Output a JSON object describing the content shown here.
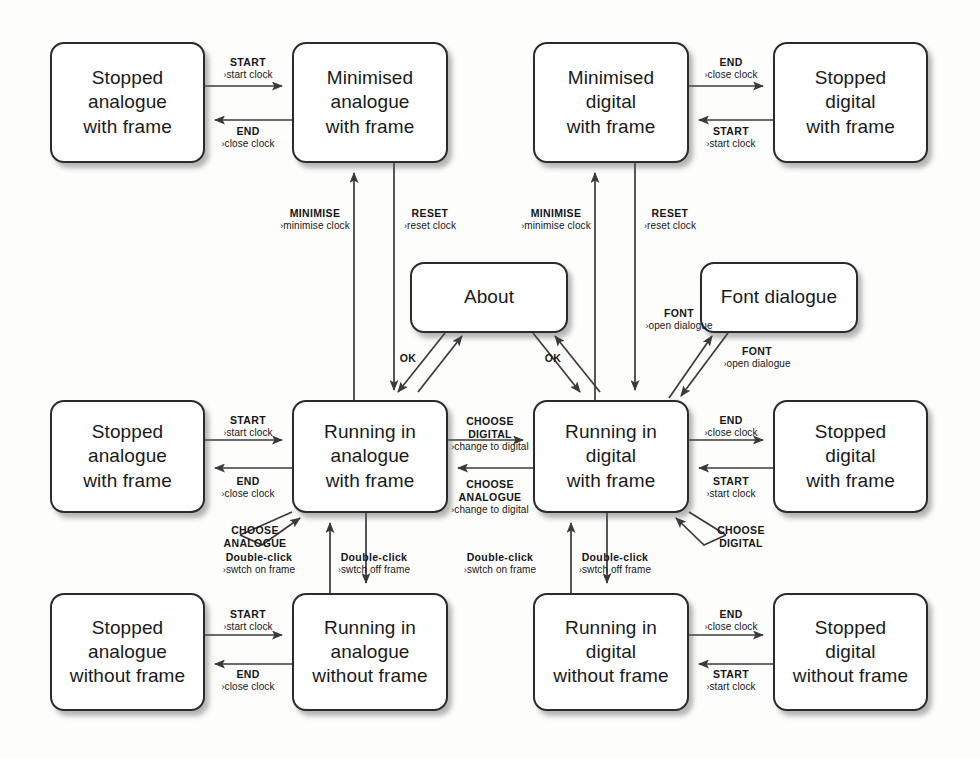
{
  "diagram": {
    "accent": "#2b2b2b",
    "background": "#fdfdfc"
  },
  "states": [
    {
      "id": "stopped-analogue-with-frame",
      "label": "Stopped\nanalogue\nwith frame",
      "x": 50,
      "y": 42,
      "w": 155,
      "h": 121
    },
    {
      "id": "minimised-analogue-with-frame",
      "label": "Minimised\nanalogue\nwith frame",
      "x": 292,
      "y": 42,
      "w": 156,
      "h": 121
    },
    {
      "id": "minimised-digital-with-frame",
      "label": "Minimised\ndigital\nwith frame",
      "x": 533,
      "y": 42,
      "w": 156,
      "h": 121
    },
    {
      "id": "stopped-digital-with-frame-top",
      "label": "Stopped\ndigital\nwith frame",
      "x": 773,
      "y": 42,
      "w": 155,
      "h": 121
    },
    {
      "id": "about",
      "label": "About",
      "x": 410,
      "y": 262,
      "w": 158,
      "h": 71
    },
    {
      "id": "font-dialogue",
      "label": "Font dialogue",
      "x": 700,
      "y": 262,
      "w": 158,
      "h": 71
    },
    {
      "id": "stopped-analogue-with-frame-2",
      "label": "Stopped\nanalogue\nwith frame",
      "x": 50,
      "y": 400,
      "w": 155,
      "h": 113
    },
    {
      "id": "running-analogue-with-frame",
      "label": "Running in\nanalogue\nwith frame",
      "x": 292,
      "y": 400,
      "w": 156,
      "h": 113
    },
    {
      "id": "running-digital-with-frame",
      "label": "Running in\ndigital\nwith frame",
      "x": 533,
      "y": 400,
      "w": 156,
      "h": 113
    },
    {
      "id": "stopped-digital-with-frame",
      "label": "Stopped\ndigital\nwith frame",
      "x": 773,
      "y": 400,
      "w": 155,
      "h": 113
    },
    {
      "id": "stopped-analogue-without-frame",
      "label": "Stopped\nanalogue\nwithout frame",
      "x": 50,
      "y": 593,
      "w": 155,
      "h": 118
    },
    {
      "id": "running-analogue-without-frame",
      "label": "Running in\nanalogue\nwithout frame",
      "x": 292,
      "y": 593,
      "w": 156,
      "h": 118
    },
    {
      "id": "running-digital-without-frame",
      "label": "Running in\ndigital\nwithout frame",
      "x": 533,
      "y": 593,
      "w": 156,
      "h": 118
    },
    {
      "id": "stopped-digital-without-frame",
      "label": "Stopped\ndigital\nwithout frame",
      "x": 773,
      "y": 593,
      "w": 155,
      "h": 118
    }
  ],
  "transitions": [
    {
      "id": "t1",
      "event": "START",
      "action": "start clock",
      "from": "stopped-analogue-with-frame",
      "to": "minimised-analogue-with-frame",
      "lx": 248,
      "ly": 56,
      "arrow": true
    },
    {
      "id": "t2",
      "event": "END",
      "action": "close clock",
      "from": "minimised-analogue-with-frame",
      "to": "stopped-analogue-with-frame",
      "lx": 248,
      "ly": 125,
      "arrow": true
    },
    {
      "id": "t3",
      "event": "END",
      "action": "close clock",
      "from": "minimised-digital-with-frame",
      "to": "stopped-digital-with-frame-top",
      "lx": 731,
      "ly": 56,
      "arrow": true
    },
    {
      "id": "t4",
      "event": "START",
      "action": "start clock",
      "from": "stopped-digital-with-frame-top",
      "to": "minimised-digital-with-frame",
      "lx": 731,
      "ly": 125,
      "arrow": true
    },
    {
      "id": "t5",
      "event": "MINIMISE",
      "action": "minimise clock",
      "from": "running-analogue-with-frame",
      "to": "minimised-analogue-with-frame",
      "lx": 315,
      "ly": 207,
      "arrow": true
    },
    {
      "id": "t6",
      "event": "RESET",
      "action": "reset clock",
      "from": "minimised-analogue-with-frame",
      "to": "running-analogue-with-frame",
      "lx": 430,
      "ly": 207,
      "arrow": true
    },
    {
      "id": "t7",
      "event": "MINIMISE",
      "action": "minimise clock",
      "from": "running-digital-with-frame",
      "to": "minimised-digital-with-frame",
      "lx": 556,
      "ly": 207,
      "arrow": true
    },
    {
      "id": "t8",
      "event": "RESET",
      "action": "reset clock",
      "from": "minimised-digital-with-frame",
      "to": "running-digital-with-frame",
      "lx": 670,
      "ly": 207,
      "arrow": true
    },
    {
      "id": "t9",
      "event": "FONT",
      "action": "open dialogue",
      "from": "running-digital-with-frame",
      "to": "font-dialogue",
      "lx": 679,
      "ly": 307,
      "arrow": true
    },
    {
      "id": "t10",
      "event": "FONT",
      "action": "open dialogue",
      "from": "font-dialogue",
      "to": "running-digital-with-frame",
      "lx": 757,
      "ly": 345,
      "arrow": true
    },
    {
      "id": "t11",
      "event": "OK",
      "action": "",
      "from": "about",
      "to": "running-analogue-with-frame",
      "lx": 408,
      "ly": 352,
      "arrow": false
    },
    {
      "id": "t12",
      "event": "OK",
      "action": "",
      "from": "about",
      "to": "running-digital-with-frame",
      "lx": 553,
      "ly": 352,
      "arrow": false
    },
    {
      "id": "t13",
      "event": "START",
      "action": "start clock",
      "from": "stopped-analogue-with-frame-2",
      "to": "running-analogue-with-frame",
      "lx": 248,
      "ly": 414,
      "arrow": true
    },
    {
      "id": "t14",
      "event": "END",
      "action": "close clock",
      "from": "running-analogue-with-frame",
      "to": "stopped-analogue-with-frame-2",
      "lx": 248,
      "ly": 475,
      "arrow": true
    },
    {
      "id": "t15",
      "event": "CHOOSE\nDIGITAL",
      "action": "change to digital",
      "from": "running-analogue-with-frame",
      "to": "running-digital-with-frame",
      "lx": 490,
      "ly": 415,
      "arrow": true
    },
    {
      "id": "t16",
      "event": "CHOOSE\nANALOGUE",
      "action": "change to digital",
      "from": "running-digital-with-frame",
      "to": "running-analogue-with-frame",
      "lx": 490,
      "ly": 478,
      "arrow": true
    },
    {
      "id": "t17",
      "event": "END",
      "action": "close clock",
      "from": "running-digital-with-frame",
      "to": "stopped-digital-with-frame",
      "lx": 731,
      "ly": 414,
      "arrow": true
    },
    {
      "id": "t18",
      "event": "START",
      "action": "start clock",
      "from": "stopped-digital-with-frame",
      "to": "running-digital-with-frame",
      "lx": 731,
      "ly": 475,
      "arrow": true
    },
    {
      "id": "t19",
      "event": "CHOOSE\nANALOGUE",
      "action": "",
      "from": "running-analogue-with-frame",
      "to": "running-analogue-with-frame",
      "lx": 255,
      "ly": 524,
      "arrow": false
    },
    {
      "id": "t20",
      "event": "CHOOSE\nDIGITAL",
      "action": "",
      "from": "running-digital-with-frame",
      "to": "running-digital-with-frame",
      "lx": 741,
      "ly": 524,
      "arrow": false
    },
    {
      "id": "t21",
      "event": "Double-click",
      "action": "swtch on frame",
      "from": "running-analogue-without-frame",
      "to": "running-analogue-with-frame",
      "lx": 259,
      "ly": 551,
      "arrow": true
    },
    {
      "id": "t22",
      "event": "Double-click",
      "action": "swtch off frame",
      "from": "running-analogue-with-frame",
      "to": "running-analogue-without-frame",
      "lx": 374,
      "ly": 551,
      "arrow": true
    },
    {
      "id": "t23",
      "event": "Double-click",
      "action": "swtch on frame",
      "from": "running-digital-without-frame",
      "to": "running-digital-with-frame",
      "lx": 500,
      "ly": 551,
      "arrow": true
    },
    {
      "id": "t24",
      "event": "Double-click",
      "action": "swtch off frame",
      "from": "running-digital-with-frame",
      "to": "running-digital-without-frame",
      "lx": 615,
      "ly": 551,
      "arrow": true
    },
    {
      "id": "t25",
      "event": "START",
      "action": "start clock",
      "from": "stopped-analogue-without-frame",
      "to": "running-analogue-without-frame",
      "lx": 248,
      "ly": 608,
      "arrow": true
    },
    {
      "id": "t26",
      "event": "END",
      "action": "close clock",
      "from": "running-analogue-without-frame",
      "to": "stopped-analogue-without-frame",
      "lx": 248,
      "ly": 668,
      "arrow": true
    },
    {
      "id": "t27",
      "event": "END",
      "action": "close clock",
      "from": "running-digital-without-frame",
      "to": "stopped-digital-without-frame",
      "lx": 731,
      "ly": 608,
      "arrow": true
    },
    {
      "id": "t28",
      "event": "START",
      "action": "start clock",
      "from": "stopped-digital-without-frame",
      "to": "running-digital-without-frame",
      "lx": 731,
      "ly": 668,
      "arrow": true
    }
  ]
}
